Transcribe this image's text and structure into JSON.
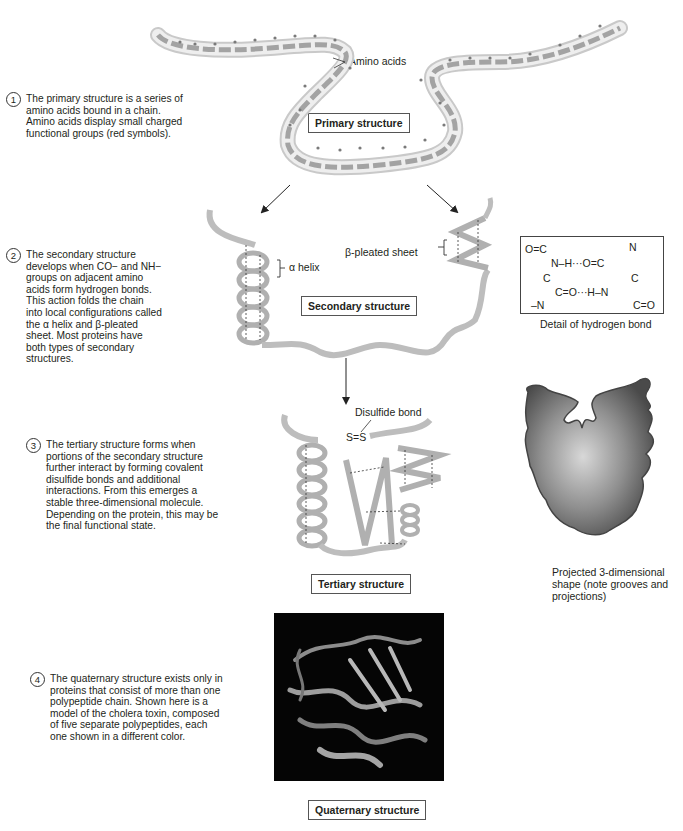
{
  "captions": [
    {
      "number": "1",
      "text": "The primary structure is a series of\namino acids bound in a chain.\nAmino acids display small charged\nfunctional groups (red symbols)."
    },
    {
      "number": "2",
      "text": "The secondary structure\ndevelops when CO− and NH−\ngroups on adjacent amino\nacids form hydrogen bonds.\nThis action folds the chain\ninto local configurations called\nthe α helix and β-pleated\nsheet. Most proteins have\nboth types of secondary\nstructures."
    },
    {
      "number": "3",
      "text": "The tertiary structure forms when\nportions of the secondary structure\nfurther interact by forming covalent\ndisulfide bonds and additional\ninteractions. From this emerges a\nstable three-dimensional molecule.\nDepending on the protein, this may be\nthe final functional state."
    },
    {
      "number": "4",
      "text": "The quaternary structure exists only in\nproteins that consist of more than one\npolypeptide chain. Shown here is a\nmodel of the cholera toxin, composed\nof five separate polypeptides, each\none shown in a different color."
    }
  ],
  "primary": {
    "title": "Primary structure",
    "amino_acids_label": "Amino acids"
  },
  "secondary": {
    "title": "Secondary structure",
    "alpha_label": "α helix",
    "beta_label": "β-pleated sheet"
  },
  "hbond_detail": {
    "caption": "Detail of hydrogen bond",
    "row1_left": "O=C",
    "row1_right": "N",
    "row2": "N–H···O=C",
    "row3_left": "C",
    "row3_right": "C",
    "row4": "C=O···H–N",
    "row5_left": "–N",
    "row5_right": "C=O"
  },
  "tertiary": {
    "title": "Tertiary structure",
    "disulfide_label": "Disulfide bond",
    "ss_label": "S=S"
  },
  "projected": {
    "caption": "Projected 3-dimensional\nshape (note grooves and\nprojections)"
  },
  "quaternary": {
    "title": "Quaternary structure"
  },
  "colors": {
    "chain": "#b9b9b9",
    "chain_edge": "#8a8a8a",
    "charge_groups": "#7a7a7a",
    "text": "#231f20"
  }
}
